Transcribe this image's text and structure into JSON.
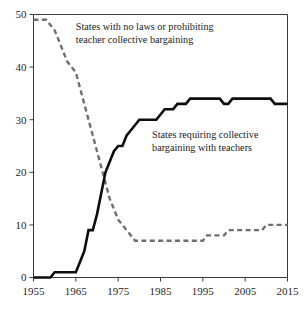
{
  "chart_data": {
    "type": "line",
    "title": "",
    "subtitle": "",
    "xlabel": "",
    "ylabel": "",
    "xlim": [
      1955,
      2015
    ],
    "ylim": [
      0,
      50
    ],
    "grid": false,
    "legend_position": "inline-annotations",
    "x_ticks": [
      "1955",
      "1965",
      "1975",
      "1985",
      "1995",
      "2005",
      "2015"
    ],
    "x_tick_values": [
      1955,
      1965,
      1975,
      1985,
      1995,
      2005,
      2015
    ],
    "y_ticks": [
      "0",
      "10",
      "20",
      "30",
      "40",
      "50"
    ],
    "y_tick_values": [
      0,
      10,
      20,
      30,
      40,
      50
    ],
    "annotations": [
      {
        "name": "annotation-no-laws",
        "line1": "States with no laws or prohibiting",
        "line2": "teacher collective bargaining",
        "x": 1965.0,
        "y": 47.0
      },
      {
        "name": "annotation-requiring",
        "line1": "States requiring collective",
        "line2": "bargaining with teachers",
        "x": 1983.0,
        "y": 26.5
      }
    ],
    "series": [
      {
        "name": "States with no laws or prohibiting teacher collective bargaining",
        "style": "dashed",
        "color": "#6f6f6f",
        "x": [
          1955,
          1956,
          1957,
          1958,
          1959,
          1960,
          1961,
          1962,
          1963,
          1964,
          1965,
          1966,
          1967,
          1968,
          1969,
          1970,
          1971,
          1972,
          1973,
          1974,
          1975,
          1976,
          1977,
          1978,
          1979,
          1980,
          1981,
          1982,
          1983,
          1984,
          1985,
          1986,
          1987,
          1988,
          1989,
          1990,
          1991,
          1992,
          1993,
          1994,
          1995,
          1996,
          1997,
          1998,
          1999,
          2000,
          2001,
          2002,
          2003,
          2004,
          2005,
          2006,
          2007,
          2008,
          2009,
          2010,
          2011,
          2012,
          2013,
          2014,
          2015
        ],
        "values": [
          49,
          49,
          49,
          49,
          48,
          47,
          45,
          43,
          41,
          40,
          39,
          36,
          33,
          30,
          27,
          24,
          21,
          18,
          15,
          13,
          11,
          10,
          9,
          8,
          7,
          7,
          7,
          7,
          7,
          7,
          7,
          7,
          7,
          7,
          7,
          7,
          7,
          7,
          7,
          7,
          7,
          8,
          8,
          8,
          8,
          8,
          9,
          9,
          9,
          9,
          9,
          9,
          9,
          9,
          9,
          10,
          10,
          10,
          10,
          10,
          10
        ]
      },
      {
        "name": "States requiring collective bargaining with teachers",
        "style": "solid",
        "color": "#0d0d0d",
        "x": [
          1955,
          1956,
          1957,
          1958,
          1959,
          1960,
          1961,
          1962,
          1963,
          1964,
          1965,
          1966,
          1967,
          1968,
          1969,
          1970,
          1971,
          1972,
          1973,
          1974,
          1975,
          1976,
          1977,
          1978,
          1979,
          1980,
          1981,
          1982,
          1983,
          1984,
          1985,
          1986,
          1987,
          1988,
          1989,
          1990,
          1991,
          1992,
          1993,
          1994,
          1995,
          1996,
          1997,
          1998,
          1999,
          2000,
          2001,
          2002,
          2003,
          2004,
          2005,
          2006,
          2007,
          2008,
          2009,
          2010,
          2011,
          2012,
          2013,
          2014,
          2015
        ],
        "values": [
          0,
          0,
          0,
          0,
          0,
          1,
          1,
          1,
          1,
          1,
          1,
          3,
          5,
          9,
          9,
          12,
          16,
          20,
          22,
          24,
          25,
          25,
          27,
          28,
          29,
          30,
          30,
          30,
          30,
          30,
          31,
          32,
          32,
          32,
          33,
          33,
          33,
          34,
          34,
          34,
          34,
          34,
          34,
          34,
          34,
          33,
          33,
          34,
          34,
          34,
          34,
          34,
          34,
          34,
          34,
          34,
          34,
          33,
          33,
          33,
          33
        ]
      }
    ]
  }
}
